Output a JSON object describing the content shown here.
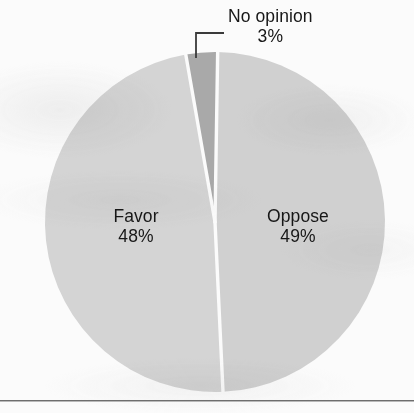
{
  "chart_data": {
    "type": "pie",
    "title": "",
    "subtitle": "",
    "xlabel": "",
    "ylabel": "",
    "legend_position": "none",
    "grid": false,
    "labels_inside_slices": true,
    "units": "percent",
    "total": 100,
    "categories": [
      "Oppose",
      "Favor",
      "No opinion"
    ],
    "values": [
      49,
      48,
      3
    ],
    "series": [
      {
        "name": "Poll results",
        "slices": [
          {
            "label": "Oppose",
            "value": 49,
            "value_text": "49%",
            "color": "#d0d0d0",
            "label_position": "inside-right"
          },
          {
            "label": "Favor",
            "value": 48,
            "value_text": "48%",
            "color": "#d4d4d4",
            "label_position": "inside-left"
          },
          {
            "label": "No opinion",
            "value": 3,
            "value_text": "3%",
            "color": "#a9a9a9",
            "label_position": "outside-top",
            "has_leader_line": true
          }
        ]
      }
    ],
    "annotations": [
      {
        "name": "no-opinion-leader-line",
        "shape": "elbow",
        "points": "(196,58)->(196,33)->(224,33)"
      }
    ]
  },
  "labels": {
    "no_opinion": {
      "name": "No opinion",
      "pct": "3%"
    },
    "favor": {
      "name": "Favor",
      "pct": "48%"
    },
    "oppose": {
      "name": "Oppose",
      "pct": "49%"
    }
  },
  "colors": {
    "background": "#fbfbfb",
    "slice_oppose": "#d0d0d0",
    "slice_favor": "#d4d4d4",
    "slice_no_opinion": "#a9a9a9",
    "slice_divider": "#fbfbfb",
    "text": "#171717",
    "rule": "#6e6e6e",
    "leader_line": "#3a3a3a"
  },
  "geometry": {
    "center_x": 215,
    "center_y": 222,
    "radius": 170
  }
}
